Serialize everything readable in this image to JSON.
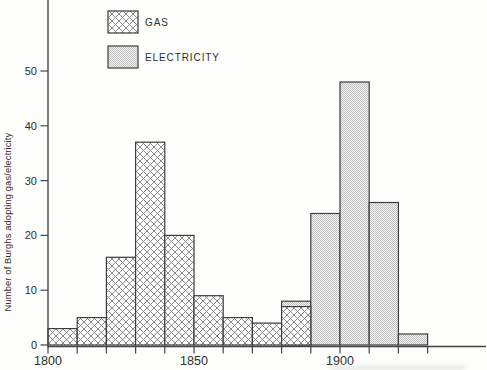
{
  "chart_data": {
    "type": "bar",
    "variant": "histogram",
    "title": "",
    "xlabel": "",
    "ylabel": "Number of Burghs adopting gas/electricity",
    "ylim": [
      0,
      58
    ],
    "y_ticks": [
      0,
      10,
      20,
      30,
      40,
      50
    ],
    "x_ticks": {
      "start": 1800,
      "end": 1930,
      "step": 10
    },
    "x_tick_labels": [
      {
        "year": 1800,
        "label": "1800"
      },
      {
        "year": 1850,
        "label": "1850"
      },
      {
        "year": 1900,
        "label": "1900"
      }
    ],
    "bin_width_years": 10,
    "grid": false,
    "legend_position": "top-left-inside",
    "series": [
      {
        "name": "GAS",
        "pattern": "crosshatch",
        "bins": [
          {
            "start": 1800,
            "count": 3
          },
          {
            "start": 1810,
            "count": 5
          },
          {
            "start": 1820,
            "count": 16
          },
          {
            "start": 1830,
            "count": 37
          },
          {
            "start": 1840,
            "count": 20
          },
          {
            "start": 1850,
            "count": 9
          },
          {
            "start": 1860,
            "count": 5
          },
          {
            "start": 1870,
            "count": 4
          },
          {
            "start": 1880,
            "count": 7
          }
        ]
      },
      {
        "name": "ELECTRICITY",
        "pattern": "stipple",
        "bins": [
          {
            "start": 1880,
            "count": 8
          },
          {
            "start": 1890,
            "count": 24
          },
          {
            "start": 1900,
            "count": 48
          },
          {
            "start": 1910,
            "count": 26
          },
          {
            "start": 1920,
            "count": 2
          }
        ]
      }
    ]
  },
  "colors": {
    "ink": "#2e2e2e",
    "axis_line": "#454545",
    "bar_outline": "#3d3d3d",
    "paper": "#fdfdfb",
    "hatch_bg": "#ffffff",
    "hatch_line": "#7e7e7e",
    "stipple_bg": "#f3f3f1",
    "stipple_dot": "#c2c2c2"
  }
}
